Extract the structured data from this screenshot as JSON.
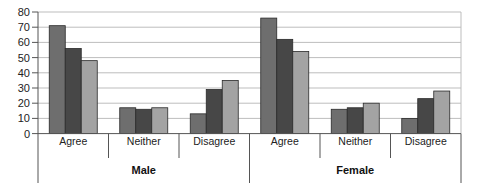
{
  "chart_data": {
    "type": "bar",
    "title": "",
    "xlabel": "",
    "ylabel": "",
    "ylim": [
      0,
      80
    ],
    "yticks": [
      0,
      10,
      20,
      30,
      40,
      50,
      60,
      70,
      80
    ],
    "grid": true,
    "legend": null,
    "groups": [
      "Male",
      "Female"
    ],
    "categories": [
      "Agree",
      "Neither",
      "Disagree",
      "Agree",
      "Neither",
      "Disagree"
    ],
    "category_groups": [
      "Male",
      "Male",
      "Male",
      "Female",
      "Female",
      "Female"
    ],
    "series": [
      {
        "name": "Series 1",
        "color": "#6e6e6e",
        "values": [
          71,
          17,
          13,
          76,
          16,
          10
        ]
      },
      {
        "name": "Series 2",
        "color": "#474747",
        "values": [
          56,
          16,
          29,
          62,
          17,
          23
        ]
      },
      {
        "name": "Series 3",
        "color": "#a3a3a3",
        "values": [
          48,
          17,
          35,
          54,
          20,
          28
        ]
      }
    ]
  },
  "colors": {
    "gridline": "#bdbdbd",
    "axis": "#555555",
    "bar_outline": "#2a2a2a"
  }
}
